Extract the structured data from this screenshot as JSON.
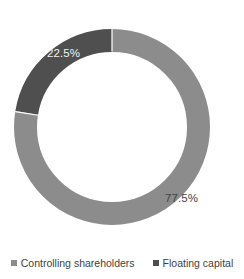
{
  "chart_data": {
    "type": "pie",
    "variant": "donut",
    "title": "",
    "subtitle": "",
    "xlabel": "",
    "ylabel": "",
    "grid": false,
    "legend_position": "bottom",
    "start_angle_deg": 0,
    "direction": "clockwise",
    "categories": [
      "Controlling shareholders",
      "Floating capital"
    ],
    "values": [
      77.5,
      22.5
    ],
    "value_unit": "%",
    "data_labels": [
      "77.5%",
      "22.5%"
    ],
    "slices": [
      {
        "name": "Controlling shareholders",
        "value": 77.5,
        "label": "77.5%",
        "color": "#8c8c8c",
        "label_color": "#444444"
      },
      {
        "name": "Floating capital",
        "value": 22.5,
        "label": "22.5%",
        "color": "#4f4f4f",
        "label_color": "#f2f2f2"
      }
    ]
  },
  "donut": {
    "label_controlling": "77.5%",
    "label_floating": "22.5%"
  },
  "legend": {
    "items": [
      {
        "label": "Controlling shareholders",
        "color": "#8c8c8c"
      },
      {
        "label": "Floating capital",
        "color": "#4f4f4f"
      }
    ]
  },
  "colors": {
    "series_light": "#8c8c8c",
    "series_dark": "#4f4f4f",
    "background": "#ffffff",
    "text": "#3f3f3f",
    "label_on_dark": "#f2f2f2",
    "label_on_light": "#444444"
  }
}
